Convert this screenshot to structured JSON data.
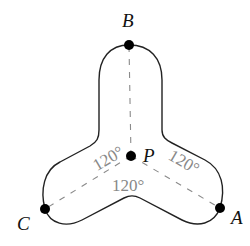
{
  "diagram": {
    "points": {
      "A": {
        "label": "A",
        "x": 220,
        "y": 208
      },
      "B": {
        "label": "B",
        "x": 129,
        "y": 45
      },
      "C": {
        "label": "C",
        "x": 45,
        "y": 209
      },
      "P": {
        "label": "P",
        "x": 131,
        "y": 156
      }
    },
    "angles": {
      "left": "120°",
      "right": "120°",
      "bottom": "120°"
    },
    "colors": {
      "outline": "#222222",
      "dashed_lines": "#8a8a8a",
      "angle_text": "#888888",
      "points": "#000000"
    }
  }
}
